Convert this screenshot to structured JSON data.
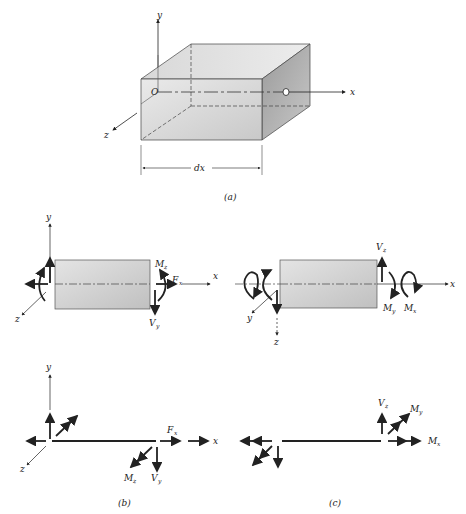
{
  "figure": {
    "panels": [
      {
        "id": "a",
        "caption": "(a)",
        "axis_labels": {
          "x": "x",
          "y": "y",
          "z": "z"
        },
        "origin_label": "O",
        "dimension_label": "dx"
      },
      {
        "id": "b",
        "caption": "(b)",
        "axis_labels": {
          "x": "x",
          "y": "y",
          "z": "z"
        },
        "force_labels": {
          "moment": "M",
          "moment_sub": "z",
          "axial": "F",
          "axial_sub": "x",
          "shear": "V",
          "shear_sub": "y"
        }
      },
      {
        "id": "c",
        "caption": "(c)",
        "axis_labels": {
          "x": "x",
          "y": "y",
          "z": "z"
        },
        "force_labels": {
          "shear": "V",
          "shear_sub": "z",
          "moment_y": "M",
          "moment_y_sub": "y",
          "moment_x": "M",
          "moment_x_sub": "x"
        }
      }
    ]
  },
  "colors": {
    "line": "#222222",
    "box_light": "#e6e6e6",
    "box_dark": "#b5b5b5",
    "background": "#ffffff"
  }
}
